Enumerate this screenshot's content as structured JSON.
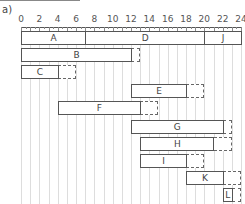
{
  "panel_label": "a)",
  "chart_data": {
    "type": "gantt",
    "title": "",
    "xlabel": "",
    "ylabel": "",
    "xlim": [
      0,
      24
    ],
    "x_ticks": [
      "0",
      "2",
      "4",
      "6",
      "8",
      "10",
      "12",
      "14",
      "16",
      "18",
      "20",
      "22",
      "24"
    ],
    "grid": true,
    "tasks": [
      {
        "name": "A",
        "start": 0,
        "end": 7,
        "slack_end": null,
        "row": 0
      },
      {
        "name": "D",
        "start": 7,
        "end": 20,
        "slack_end": null,
        "row": 0
      },
      {
        "name": "J",
        "start": 20,
        "end": 24,
        "slack_end": null,
        "row": 0
      },
      {
        "name": "B",
        "start": 0,
        "end": 12,
        "slack_end": 13,
        "row": 1
      },
      {
        "name": "C",
        "start": 0,
        "end": 4,
        "slack_end": 6,
        "row": 2
      },
      {
        "name": "E",
        "start": 12,
        "end": 18,
        "slack_end": 20,
        "row": 3
      },
      {
        "name": "F",
        "start": 4,
        "end": 13,
        "slack_end": 15,
        "row": 4
      },
      {
        "name": "G",
        "start": 12,
        "end": 22,
        "slack_end": 23,
        "row": 5
      },
      {
        "name": "H",
        "start": 13,
        "end": 21,
        "slack_end": 23,
        "row": 6
      },
      {
        "name": "I",
        "start": 13,
        "end": 18,
        "slack_end": 20,
        "row": 7
      },
      {
        "name": "K",
        "start": 18,
        "end": 22,
        "slack_end": 24,
        "row": 8
      },
      {
        "name": "L",
        "start": 22,
        "end": 23,
        "slack_end": 24,
        "row": 9
      }
    ],
    "legend": "solid box = activity duration; dashed box = float/slack"
  }
}
